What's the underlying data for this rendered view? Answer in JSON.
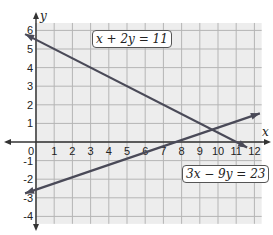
{
  "chart_data": {
    "type": "line",
    "title": "",
    "xlabel": "x",
    "ylabel": "y",
    "xlim": [
      -1,
      12.4
    ],
    "ylim": [
      -4.4,
      6.4
    ],
    "grid": true,
    "x_ticks": [
      "0",
      "1",
      "2",
      "3",
      "4",
      "5",
      "6",
      "7",
      "8",
      "9",
      "10",
      "11",
      "12"
    ],
    "y_ticks": [
      "6",
      "5",
      "4",
      "3",
      "2",
      "1",
      "-1",
      "-2",
      "-3",
      "-4"
    ],
    "series": [
      {
        "name": "x + 2y = 11",
        "slope": -0.5,
        "intercept": 5.5,
        "x": [
          -0.6,
          11.6
        ],
        "y": [
          5.8,
          -0.3
        ]
      },
      {
        "name": "3x - 9y = 23",
        "slope": 0.3333,
        "intercept": -2.5556,
        "x": [
          -0.6,
          12.3
        ],
        "y": [
          -2.76,
          1.54
        ]
      }
    ],
    "annotations": [
      {
        "text": "x + 2y = 11",
        "near": [
          3.5,
          5.5
        ]
      },
      {
        "text": "3x − 9y = 23",
        "near": [
          8.5,
          -2.1
        ]
      }
    ]
  },
  "labels": {
    "eq1": "x + 2y = 11",
    "eq2": "3x − 9y = 23",
    "x_axis": "x",
    "y_axis": "y"
  },
  "colors": {
    "grid_bg": "#ededed",
    "grid_line": "#b5b5b5",
    "line": "#4a4a58",
    "axis": "#333333"
  }
}
